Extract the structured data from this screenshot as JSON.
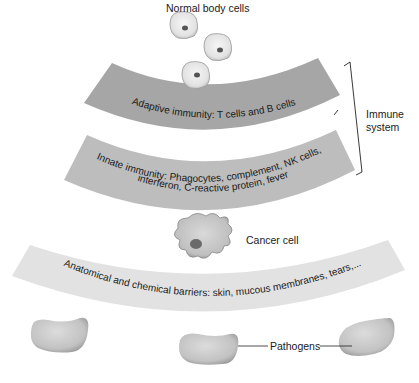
{
  "diagram": {
    "labels": {
      "normal_cells": "Normal body cells",
      "adaptive": "Adaptive immunity: T cells and B cells",
      "innate_line1": "Innate immunity: Phagocytes, complement, NK cells,",
      "innate_line2": "interferon, C-reactive protein, fever",
      "immune_system_line1": "Immune",
      "immune_system_line2": "system",
      "cancer_cell": "Cancer cell",
      "barriers": "Anatomical and chemical barriers: skin, mucous membranes, tears,...",
      "pathogens": "Pathogens"
    },
    "colors": {
      "adaptive_band": "#a6a6a6",
      "innate_band": "#bdbdbd",
      "barrier_band": "#e2e2e2",
      "pathogen": "#c4c4c4",
      "text": "#1a1a1a"
    }
  }
}
